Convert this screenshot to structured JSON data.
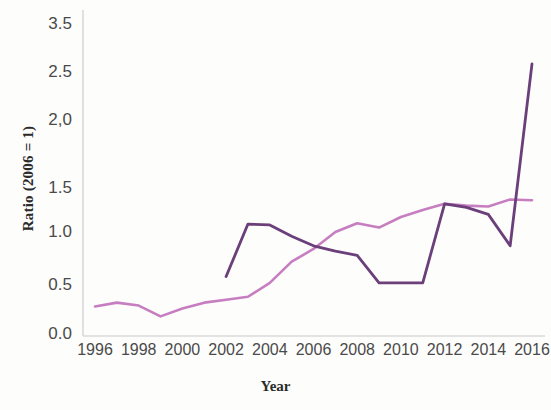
{
  "chart_data": {
    "type": "line",
    "title": "",
    "xlabel": "Year",
    "ylabel": "Ratio (2006 = 1)",
    "xlim": [
      1995,
      2016.5
    ],
    "ylim": [
      0.0,
      3.5
    ],
    "grid": false,
    "legend": "none",
    "x_tick_labels": [
      "1996",
      "1998",
      "2000",
      "2002",
      "2004",
      "2006",
      "2008",
      "2010",
      "2012",
      "2014",
      "2016"
    ],
    "x_tick_values": [
      1996,
      1998,
      2000,
      2002,
      2004,
      2006,
      2008,
      2010,
      2012,
      2014,
      2016
    ],
    "y_tick_labels": [
      "3.5",
      "2.5",
      "2,0",
      "1.5",
      "1.0",
      "0.5",
      "0.0"
    ],
    "y_tick_values": [
      3.5,
      2.5,
      2.0,
      1.5,
      1.0,
      0.5,
      0.0
    ],
    "series": [
      {
        "name": "light-pink-series",
        "color": "#c77ec0",
        "x": [
          1996,
          1997,
          1998,
          1999,
          2000,
          2001,
          2002,
          2003,
          2004,
          2005,
          2006,
          2007,
          2008,
          2009,
          2010,
          2011,
          2012,
          2013,
          2014,
          2015,
          2016
        ],
        "values": [
          0.28,
          0.32,
          0.29,
          0.18,
          0.26,
          0.32,
          0.35,
          0.38,
          0.52,
          0.72,
          0.84,
          1.0,
          1.1,
          1.05,
          1.17,
          1.25,
          1.32,
          1.3,
          1.29,
          1.37,
          1.36
        ]
      },
      {
        "name": "dark-purple-series",
        "color": "#6b3f7a",
        "x": [
          2002,
          2003,
          2004,
          2005,
          2006,
          2007,
          2008,
          2009,
          2010,
          2011,
          2012,
          2013,
          2014,
          2015,
          2016
        ],
        "values": [
          0.58,
          1.09,
          1.08,
          0.96,
          0.87,
          0.82,
          0.78,
          0.52,
          0.52,
          0.52,
          1.32,
          1.28,
          1.2,
          0.87,
          2.67
        ]
      }
    ]
  },
  "axis_titles": {
    "x": "Year",
    "y": "Ratio (2006 = 1)"
  }
}
